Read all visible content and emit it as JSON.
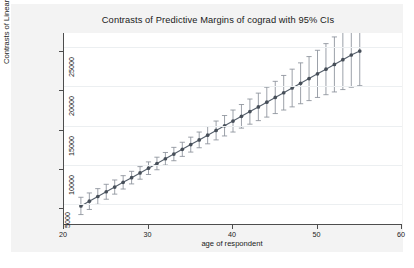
{
  "chart_data": {
    "type": "scatter",
    "title": "Contrasts of Predictive Margins of cograd with 95% CIs",
    "xlabel": "age of respondent",
    "ylabel": "Contrasts of Linear Prediction",
    "xlim": [
      20,
      60
    ],
    "ylim": [
      2500,
      26800
    ],
    "xticks": [
      20,
      30,
      40,
      50,
      60
    ],
    "yticks": [
      5000,
      10000,
      15000,
      20000,
      25000
    ],
    "grid": "horizontal",
    "legend": "none",
    "marker": "filled-circle",
    "error_bars": "95% confidence interval (capped)",
    "line_color": "#555f6b",
    "marker_color": "#474f59",
    "errorbar_color": "#8a9099",
    "series": [
      {
        "name": "Contrasts of Linear Prediction",
        "x": [
          22,
          23,
          24,
          25,
          26,
          27,
          28,
          29,
          30,
          31,
          32,
          33,
          34,
          35,
          36,
          37,
          38,
          39,
          40,
          41,
          42,
          43,
          44,
          45,
          46,
          47,
          48,
          49,
          50,
          51,
          52,
          53,
          54,
          55
        ],
        "y": [
          4800,
          5400,
          6000,
          6600,
          7200,
          7800,
          8400,
          9000,
          9600,
          10200,
          10800,
          11400,
          12000,
          12600,
          13200,
          13800,
          14400,
          15000,
          15600,
          16200,
          16800,
          17400,
          18000,
          18600,
          19200,
          19800,
          20400,
          21000,
          21600,
          22200,
          22800,
          23400,
          24000,
          24500
        ],
        "ci_low": [
          3700,
          4350,
          5000,
          5650,
          6300,
          6950,
          7600,
          8200,
          8800,
          9400,
          10000,
          10550,
          11100,
          11650,
          12200,
          12700,
          13200,
          13700,
          14200,
          14700,
          15200,
          15650,
          16100,
          16550,
          17000,
          17400,
          17800,
          18200,
          18600,
          18950,
          19300,
          19600,
          19900,
          20100
        ],
        "ci_high": [
          5900,
          6450,
          7000,
          7550,
          8100,
          8650,
          9200,
          9800,
          10400,
          11000,
          11600,
          12250,
          12900,
          13550,
          14200,
          14900,
          15600,
          16300,
          17000,
          17700,
          18400,
          19150,
          19900,
          20650,
          21400,
          22200,
          23000,
          23800,
          24600,
          25450,
          26300,
          27200,
          28100,
          28900
        ]
      }
    ]
  },
  "colors": {
    "paper": "#f3f3f3",
    "plot_background": "#ffffff",
    "axis": "#4d4d4d",
    "grid": "#eceff1",
    "text": "#1a1a1a"
  }
}
